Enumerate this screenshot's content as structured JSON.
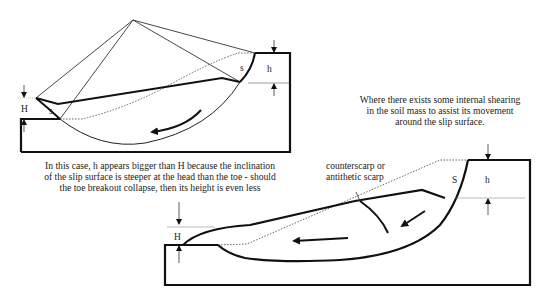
{
  "diagram_1": {
    "name": "Rotational slip with steeper head",
    "labels": {
      "H": "H",
      "h": "h",
      "s_toe": "s",
      "s_head": "s"
    },
    "caption_lines": [
      "In this case, h appears bigger than H because the inclination",
      "of the slip surface is steeper at the head than the toe - should",
      "the toe breakout collapse, then its height is even less"
    ]
  },
  "diagram_2": {
    "name": "Slip with internal shearing",
    "labels": {
      "H": "H",
      "h": "h",
      "S": "S"
    },
    "annotation_lines": [
      "counterscarp or",
      "antithetic scarp"
    ],
    "caption_lines": [
      "Where there exists some internal shearing",
      "in the soil mass to assist its movement",
      "around the slip surface."
    ]
  }
}
